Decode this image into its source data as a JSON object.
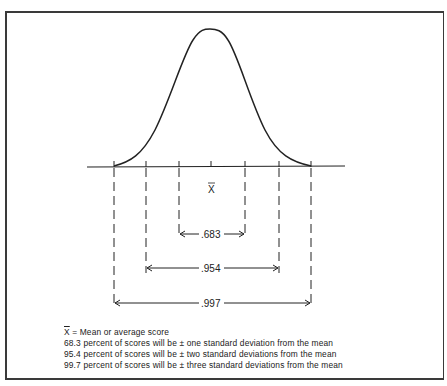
{
  "diagram": {
    "type": "normal-distribution-curve",
    "mean_label": "X",
    "ranges": [
      {
        "label": ".683",
        "sigma": 1
      },
      {
        "label": ".954",
        "sigma": 2
      },
      {
        "label": ".997",
        "sigma": 3
      }
    ]
  },
  "legend": {
    "mean_symbol": "X",
    "mean_text": " = Mean or average score",
    "lines": [
      "68.3 percent of scores will be ± one standard deviation from the mean",
      "95.4 percent of scores will be ± two standard deviations from the mean",
      "99.7 percent of scores will be ± three standard deviations from the mean"
    ]
  },
  "colors": {
    "ink": "#222222",
    "frame": "#3a3a3a",
    "background": "#ffffff"
  }
}
